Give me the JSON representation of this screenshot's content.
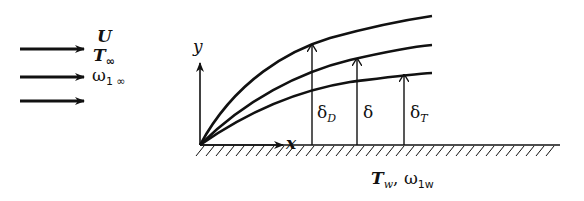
{
  "diagram": {
    "freestream": {
      "velocity_label": "U",
      "temperature_label": "T",
      "temperature_sub": "∞",
      "concentration_label": "ω",
      "concentration_sub": "1 ∞",
      "arrow_count": 3
    },
    "axes": {
      "x_label": "x",
      "y_label": "y"
    },
    "boundary_layers": [
      {
        "name": "concentration",
        "label": "δ",
        "sub": "D",
        "position": "top"
      },
      {
        "name": "velocity",
        "label": "δ",
        "sub": "",
        "position": "middle"
      },
      {
        "name": "thermal",
        "label": "δ",
        "sub": "T",
        "position": "bottom"
      }
    ],
    "wall": {
      "temperature_label": "T",
      "temperature_sub": "w",
      "separator": ",",
      "concentration_label": "ω",
      "concentration_sub": "1w"
    },
    "colors": {
      "ink": "#111111",
      "background": "#ffffff"
    }
  }
}
